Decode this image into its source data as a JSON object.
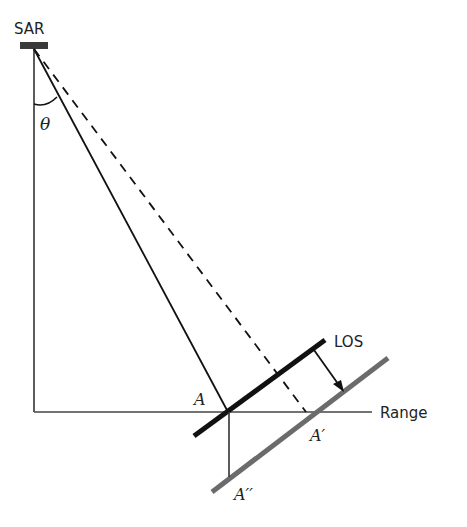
{
  "diagram": {
    "labels": {
      "sensor": "SAR",
      "angle": "θ",
      "los": "LOS",
      "range": "Range",
      "point_a": "A",
      "point_a_prime": "A′",
      "point_a_double_prime": "A′′"
    },
    "colors": {
      "line": "#111111",
      "shifted_line": "#6b6b6b",
      "sensor_box": "#3a3a3a"
    }
  }
}
